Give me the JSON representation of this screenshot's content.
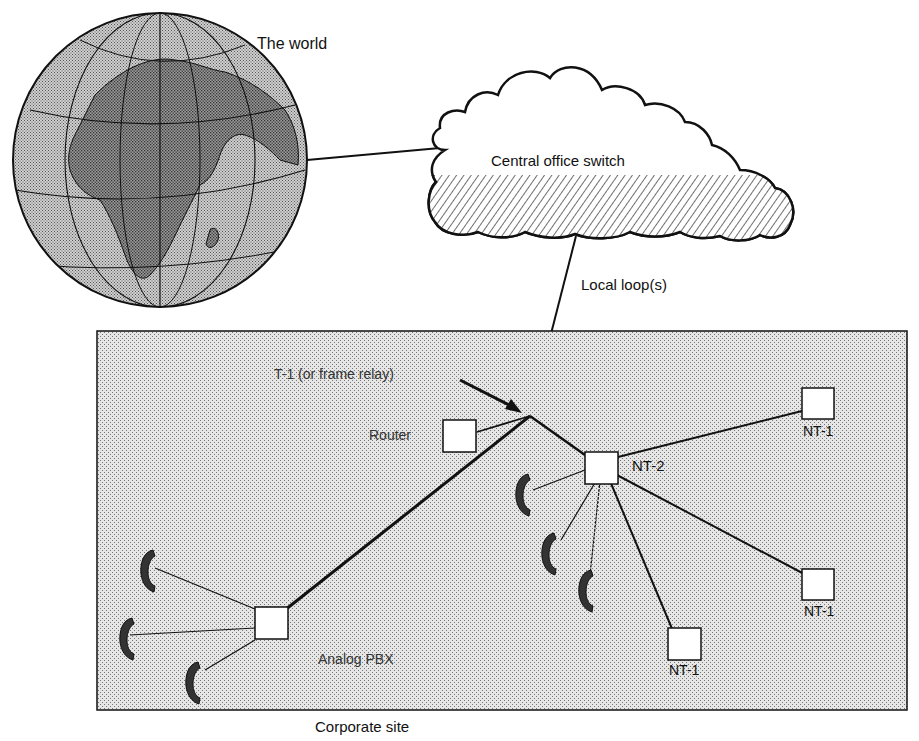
{
  "diagram": {
    "type": "network-topology",
    "nodes": {
      "world": {
        "label": "The world",
        "icon": "globe-icon"
      },
      "central_office": {
        "label": "Central office switch",
        "icon": "cloud-icon"
      },
      "corporate_site": {
        "label": "Corporate site"
      },
      "router": {
        "label": "Router"
      },
      "nt2": {
        "label": "NT-2"
      },
      "nt1_top": {
        "label": "NT-1"
      },
      "nt1_right": {
        "label": "NT-1"
      },
      "nt1_bottom": {
        "label": "NT-1"
      },
      "pbx": {
        "label": "Analog PBX"
      }
    },
    "edge_labels": {
      "local_loop": "Local loop(s)",
      "t1": "T-1 (or frame relay)"
    },
    "phones": {
      "nt2_count": 3,
      "pbx_count": 3,
      "icon": "telephone-handset-icon"
    },
    "colors": {
      "stroke": "#111111",
      "site_fill": "#d6d6d6",
      "box_fill": "#ffffff"
    }
  }
}
